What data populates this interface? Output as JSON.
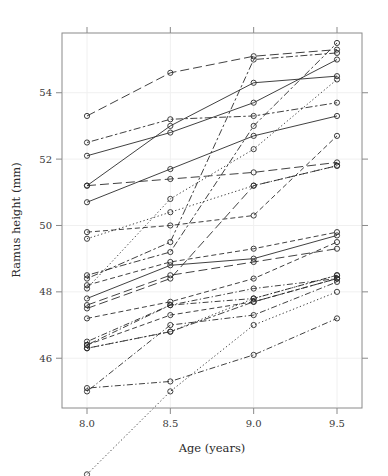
{
  "chart_data": {
    "type": "line",
    "title": "",
    "xlabel": "Age (years)",
    "ylabel": "Ramus height (mm)",
    "x": [
      8.0,
      8.5,
      9.0,
      9.5
    ],
    "xtick_labels": [
      "8.0",
      "8.5",
      "9.0",
      "9.5"
    ],
    "ytick_values": [
      46,
      48,
      50,
      52,
      54
    ],
    "ytick_labels": [
      "46",
      "48",
      "50",
      "52",
      "54"
    ],
    "xlim": [
      7.85,
      9.65
    ],
    "ylim": [
      44.5,
      55.8
    ],
    "grid": true,
    "legend": "none",
    "marker": "open-circle",
    "series": [
      {
        "name": "subject-1",
        "linetype": "solid",
        "values": [
          47.8,
          48.8,
          49.0,
          49.7
        ]
      },
      {
        "name": "subject-2",
        "linetype": "dashed",
        "values": [
          46.4,
          47.3,
          47.7,
          48.4
        ]
      },
      {
        "name": "subject-3",
        "linetype": "dotted",
        "values": [
          46.3,
          46.8,
          47.8,
          48.5
        ]
      },
      {
        "name": "subject-4",
        "linetype": "dotdash",
        "values": [
          45.1,
          45.3,
          46.1,
          47.2
        ]
      },
      {
        "name": "subject-5",
        "linetype": "longdash",
        "values": [
          47.6,
          48.5,
          48.9,
          49.3
        ]
      },
      {
        "name": "subject-6",
        "linetype": "twodash",
        "values": [
          52.5,
          53.2,
          53.3,
          53.7
        ]
      },
      {
        "name": "subject-7",
        "linetype": "solid",
        "values": [
          51.2,
          53.0,
          54.3,
          54.5
        ]
      },
      {
        "name": "subject-8",
        "linetype": "dashed",
        "values": [
          49.8,
          50.0,
          50.3,
          52.7
        ]
      },
      {
        "name": "subject-9",
        "linetype": "dotted",
        "values": [
          48.1,
          50.8,
          52.3,
          54.4
        ]
      },
      {
        "name": "subject-10",
        "linetype": "dotdash",
        "values": [
          45.0,
          47.0,
          47.3,
          48.3
        ]
      },
      {
        "name": "subject-11",
        "linetype": "longdash",
        "values": [
          51.2,
          51.4,
          51.6,
          51.9
        ]
      },
      {
        "name": "subject-12",
        "linetype": "twodash",
        "values": [
          48.5,
          49.2,
          53.0,
          55.5
        ]
      },
      {
        "name": "subject-13",
        "linetype": "solid",
        "values": [
          52.1,
          52.8,
          53.7,
          55.0
        ]
      },
      {
        "name": "subject-14",
        "linetype": "dashed",
        "values": [
          48.2,
          48.9,
          49.3,
          49.8
        ]
      },
      {
        "name": "subject-15",
        "linetype": "dotted",
        "values": [
          42.5,
          45.0,
          47.0,
          48.0
        ]
      },
      {
        "name": "subject-16",
        "linetype": "dotdash",
        "values": [
          46.5,
          47.6,
          48.1,
          48.4
        ]
      },
      {
        "name": "subject-17",
        "linetype": "longdash",
        "values": [
          53.3,
          54.6,
          55.1,
          55.3
        ]
      },
      {
        "name": "subject-18",
        "linetype": "twodash",
        "values": [
          46.3,
          46.8,
          47.7,
          48.4
        ]
      },
      {
        "name": "subject-19",
        "linetype": "solid",
        "values": [
          50.7,
          51.7,
          52.7,
          53.3
        ]
      },
      {
        "name": "subject-20",
        "linetype": "dashed",
        "values": [
          47.2,
          47.7,
          48.4,
          49.5
        ]
      },
      {
        "name": "subject-21",
        "linetype": "dotted",
        "values": [
          49.6,
          50.4,
          51.2,
          51.8
        ]
      },
      {
        "name": "subject-22",
        "linetype": "dotdash",
        "values": [
          46.4,
          47.6,
          47.8,
          48.5
        ]
      },
      {
        "name": "subject-23",
        "linetype": "longdash",
        "values": [
          47.5,
          48.4,
          51.2,
          51.8
        ]
      },
      {
        "name": "subject-24",
        "linetype": "twodash",
        "values": [
          48.4,
          49.5,
          55.0,
          55.2
        ]
      }
    ]
  },
  "axes": {
    "x_title": "Age (years)",
    "y_title": "Ramus height (mm)"
  }
}
